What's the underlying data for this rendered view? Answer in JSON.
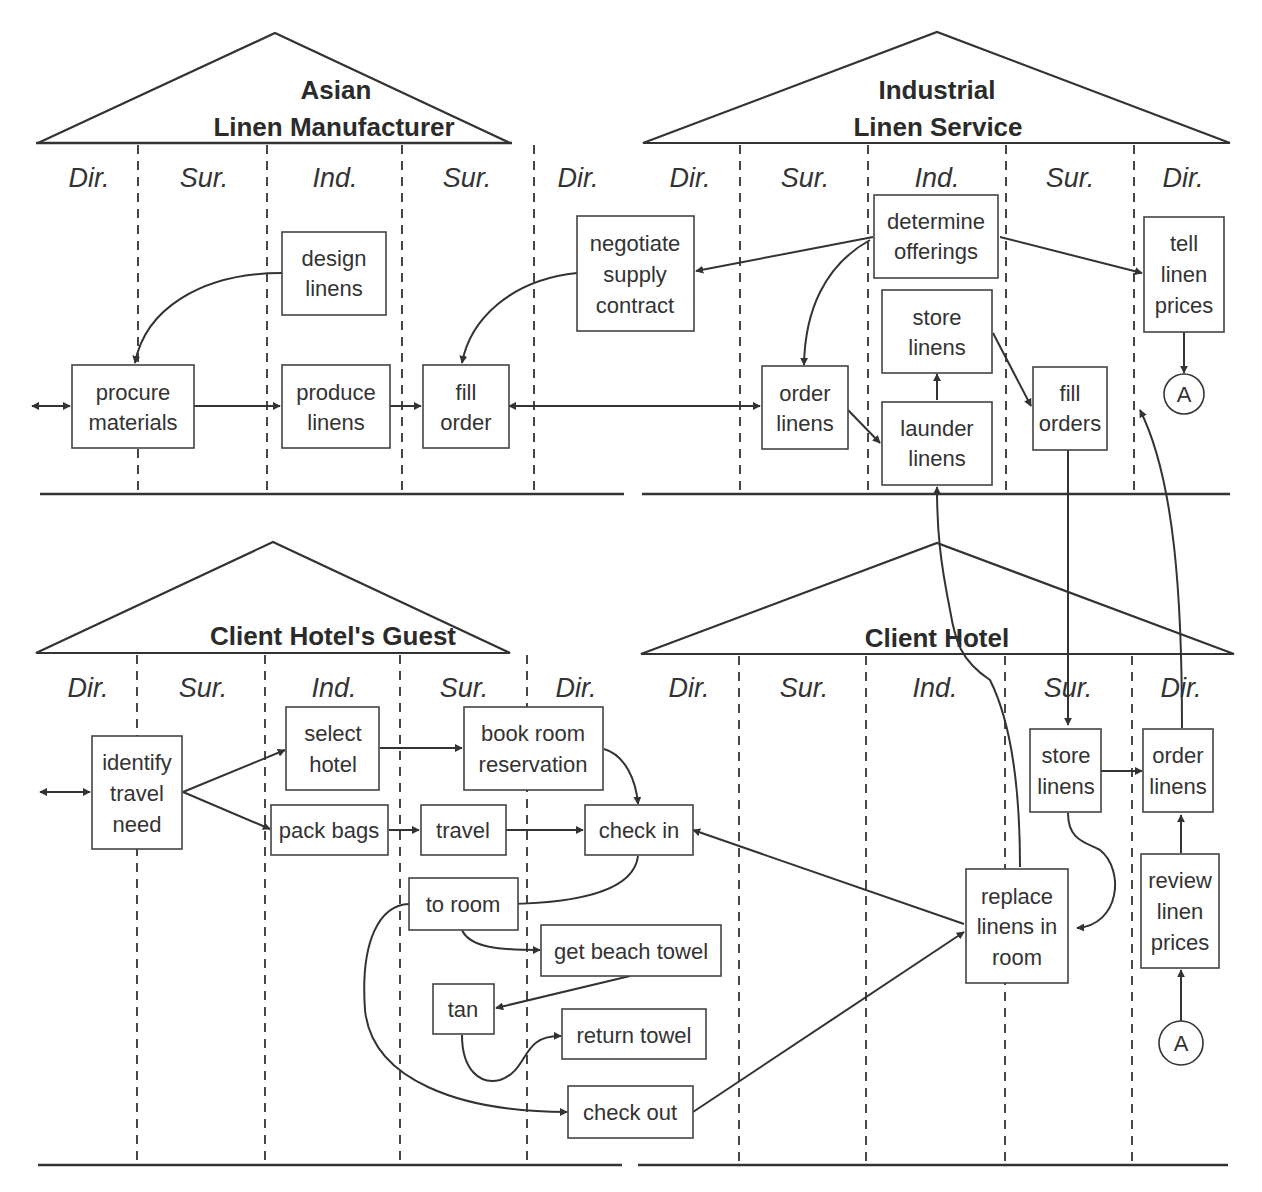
{
  "quadrants": [
    {
      "id": "asian-linen-manufacturer",
      "title_lines": [
        "Asian",
        "Linen Manufacturer"
      ],
      "lanes": [
        "Dir.",
        "Sur.",
        "Ind.",
        "Sur.",
        "Dir."
      ]
    },
    {
      "id": "industrial-linen-service",
      "title_lines": [
        "Industrial",
        "Linen Service"
      ],
      "lanes": [
        "Dir.",
        "Sur.",
        "Ind.",
        "Sur.",
        "Dir."
      ]
    },
    {
      "id": "client-hotels-guest",
      "title_lines": [
        "Client Hotel's Guest"
      ],
      "lanes": [
        "Dir.",
        "Sur.",
        "Ind.",
        "Sur.",
        "Dir."
      ]
    },
    {
      "id": "client-hotel",
      "title_lines": [
        "Client Hotel"
      ],
      "lanes": [
        "Dir.",
        "Sur.",
        "Ind.",
        "Sur.",
        "Dir."
      ]
    }
  ],
  "processes": {
    "design_linens": [
      "design",
      "linens"
    ],
    "procure_materials": [
      "procure",
      "materials"
    ],
    "produce_linens": [
      "produce",
      "linens"
    ],
    "fill_order": [
      "fill",
      "order"
    ],
    "negotiate_supply_contract": [
      "negotiate",
      "supply",
      "contract"
    ],
    "determine_offerings": [
      "determine",
      "offerings"
    ],
    "tell_linen_prices": [
      "tell",
      "linen",
      "prices"
    ],
    "store_linens_ils": [
      "store",
      "linens"
    ],
    "order_linens_ils": [
      "order",
      "linens"
    ],
    "launder_linens": [
      "launder",
      "linens"
    ],
    "fill_orders": [
      "fill",
      "orders"
    ],
    "identify_travel_need": [
      "identify",
      "travel",
      "need"
    ],
    "select_hotel": [
      "select",
      "hotel"
    ],
    "book_room_reservation": [
      "book room",
      "reservation"
    ],
    "pack_bags": [
      "pack bags"
    ],
    "travel": [
      "travel"
    ],
    "check_in": [
      "check in"
    ],
    "to_room": [
      "to room"
    ],
    "get_beach_towel": [
      "get beach towel"
    ],
    "tan": [
      "tan"
    ],
    "return_towel": [
      "return towel"
    ],
    "check_out": [
      "check out"
    ],
    "replace_linens_in_room": [
      "replace",
      "linens in",
      "room"
    ],
    "store_linens_ch": [
      "store",
      "linens"
    ],
    "order_linens_ch": [
      "order",
      "linens"
    ],
    "review_linen_prices": [
      "review",
      "linen",
      "prices"
    ]
  },
  "connectors": {
    "top": "A",
    "bottom": "A"
  }
}
